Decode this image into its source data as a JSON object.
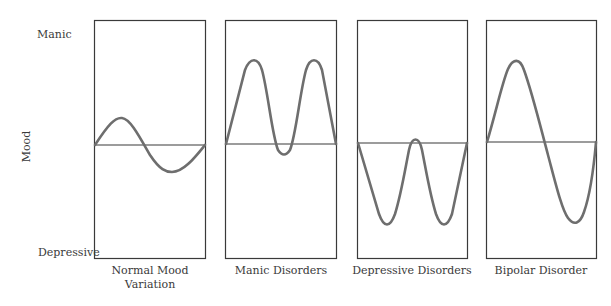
{
  "axis": {
    "ylabel": "Mood",
    "top_label": "Manic",
    "bottom_label": "Depressive"
  },
  "panels": [
    {
      "title_line1": "Normal Mood",
      "title_line2": "Variation",
      "pattern": "small sine: mild high then mild low"
    },
    {
      "title_line1": "Manic Disorders",
      "title_line2": "",
      "pattern": "two large highs with small dip below baseline"
    },
    {
      "title_line1": "Depressive Disorders",
      "title_line2": "",
      "pattern": "two large lows with small peak above baseline"
    },
    {
      "title_line1": "Bipolar Disorder",
      "title_line2": "",
      "pattern": "one large high then one large low"
    }
  ],
  "colors": {
    "curve": "#6e6e6e",
    "frame": "#3a3a3a"
  }
}
